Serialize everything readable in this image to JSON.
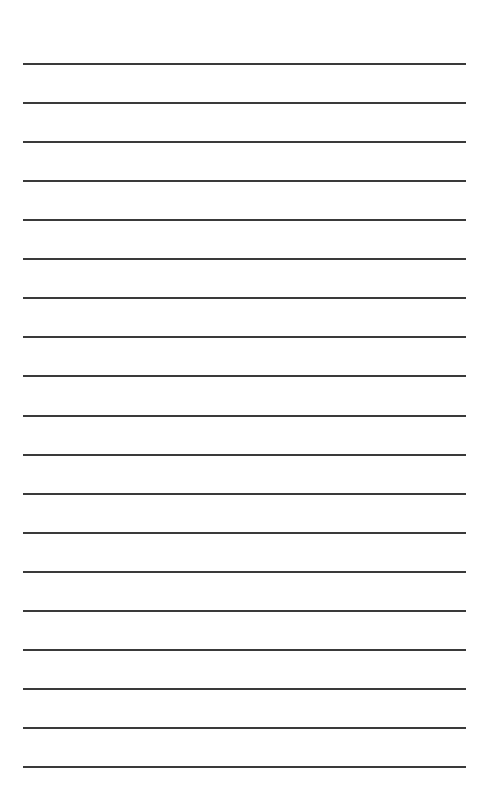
{
  "page": {
    "background": "#ffffff",
    "line_color": "#3a3a3a",
    "line_count": 19,
    "first_line_y": 63,
    "line_spacing": 39.06,
    "line_left": 23,
    "line_width": 443
  }
}
